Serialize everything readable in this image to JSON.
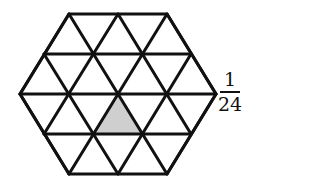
{
  "diagram": {
    "shape": "hexagon subdivided into 24 equilateral triangles",
    "triangle_count": 24,
    "shaded_triangles": 1,
    "shaded_color": "#cfcfcf",
    "line_color": "#111111",
    "vertices": {
      "top": [
        69,
        14
      ],
      "top_right": [
        167,
        14
      ],
      "right": [
        216,
        94
      ],
      "bottom_right": [
        167,
        174
      ],
      "bottom_left": [
        69,
        174
      ],
      "left": [
        20,
        94
      ],
      "center": [
        118,
        94
      ]
    }
  },
  "label": {
    "numerator": "1",
    "denominator": "24"
  }
}
